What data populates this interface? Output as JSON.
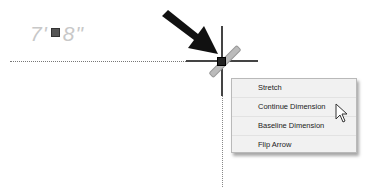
{
  "canvas": {
    "dimension_text_left": "7'",
    "dimension_text_right": "8\""
  },
  "context_menu": {
    "items": [
      {
        "label": "Stretch"
      },
      {
        "label": "Continue Dimension"
      },
      {
        "label": "Baseline Dimension"
      },
      {
        "label": "Flip Arrow"
      }
    ]
  },
  "icons": {
    "pointer_arrow": "large-black-arrow-icon",
    "cursor": "mouse-cursor-icon"
  }
}
